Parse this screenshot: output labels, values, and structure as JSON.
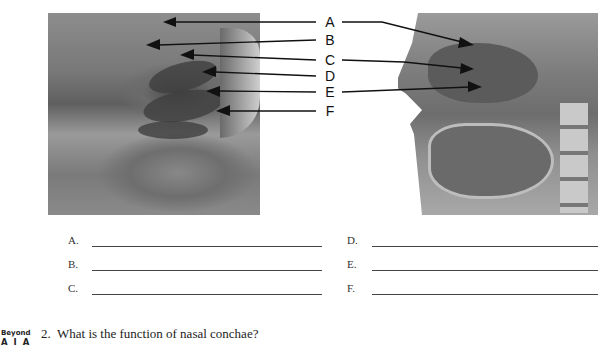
{
  "figure": {
    "left_image": {
      "description": "photo of sagittal dissection of nasal cavity (grayscale)"
    },
    "right_image": {
      "description": "illustration of sagittal section of head showing nasal cavity, mouth, and spine (grayscale)"
    },
    "labels": [
      "A",
      "B",
      "C",
      "D",
      "E",
      "F"
    ]
  },
  "answer_lines": {
    "left_column": [
      {
        "letter": "A.",
        "value": ""
      },
      {
        "letter": "B.",
        "value": ""
      },
      {
        "letter": "C.",
        "value": ""
      }
    ],
    "right_column": [
      {
        "letter": "D.",
        "value": ""
      },
      {
        "letter": "E.",
        "value": ""
      },
      {
        "letter": "F.",
        "value": ""
      }
    ]
  },
  "badge": {
    "line1": "Beyond",
    "line2": "A I A"
  },
  "question": {
    "number": "2.",
    "text": "What is the function of nasal conchae?"
  }
}
